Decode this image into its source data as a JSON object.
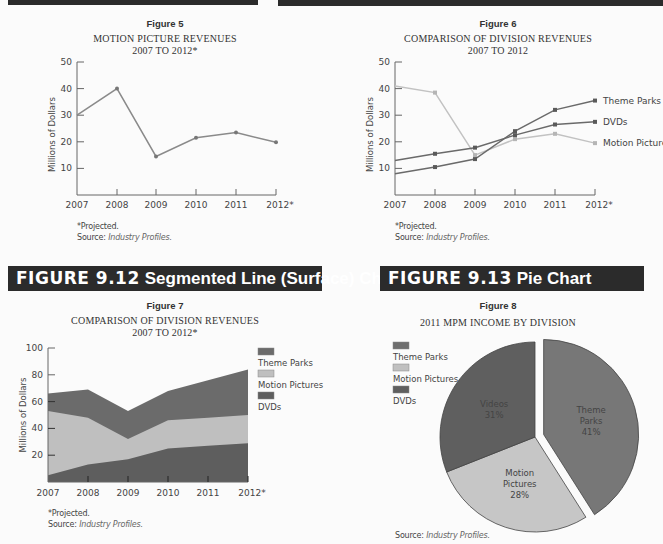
{
  "sections": {
    "top_left_bar": "",
    "top_right_bar": "",
    "fig912": {
      "num": "FIGURE 9.12",
      "title": "Segmented Line (Surface) Chart"
    },
    "fig913": {
      "num": "FIGURE 9.13",
      "title": "Pie Chart"
    }
  },
  "notes": {
    "projected": "*Projected.",
    "source_label": "Source:",
    "source_value": "Industry Profiles."
  },
  "colors": {
    "header_bar": "#2b2b2b",
    "theme_parks": "#6e6e6e",
    "motion_pictures": "#bdbdbd",
    "dvds": "#555555",
    "axis": "#666666"
  },
  "chart_data": [
    {
      "id": "figure5",
      "figure_label": "Figure 5",
      "type": "line",
      "title": "MOTION PICTURE REVENUES",
      "subtitle": "2007 TO 2012*",
      "xlabel": "",
      "ylabel": "Millions of Dollars",
      "x": [
        "2007",
        "2008",
        "2009",
        "2010",
        "2011",
        "2012*"
      ],
      "yticks": [
        10,
        20,
        30,
        40,
        50
      ],
      "ylim": [
        0,
        50
      ],
      "grid": false,
      "series": [
        {
          "name": "Motion Pictures",
          "values": [
            30,
            40,
            14.5,
            21.5,
            23.5,
            19.8
          ]
        }
      ],
      "notes": [
        "*Projected.",
        "Source: Industry Profiles."
      ]
    },
    {
      "id": "figure6",
      "figure_label": "Figure 6",
      "type": "line",
      "title": "COMPARISON OF DIVISION REVENUES",
      "subtitle": "2007 TO 2012",
      "xlabel": "",
      "ylabel": "Millions of Dollars",
      "x": [
        "2007",
        "2008",
        "2009",
        "2010",
        "2011",
        "2012*"
      ],
      "yticks": [
        10,
        20,
        30,
        40,
        50
      ],
      "ylim": [
        0,
        50
      ],
      "grid": false,
      "legend_position": "right (line-end labels)",
      "series": [
        {
          "name": "Theme Parks",
          "values": [
            8,
            10.5,
            13.5,
            24,
            32,
            35.5
          ]
        },
        {
          "name": "DVDs",
          "values": [
            13,
            15.5,
            17.8,
            22.5,
            26.5,
            27.5
          ]
        },
        {
          "name": "Motion Pictures",
          "values": [
            41,
            38.5,
            15,
            21,
            23,
            19.5
          ]
        }
      ],
      "notes": [
        "*Projected.",
        "Source: Industry Profiles."
      ]
    },
    {
      "id": "figure7",
      "figure_label": "Figure 7",
      "type": "area",
      "stacked": true,
      "title": "COMPARISON OF DIVISION REVENUES",
      "subtitle": "2007 TO 2012*",
      "xlabel": "",
      "ylabel": "Millions of Dollars",
      "x": [
        "2007",
        "2008",
        "2009",
        "2010",
        "2011",
        "2012*"
      ],
      "yticks": [
        20,
        40,
        60,
        80,
        100
      ],
      "ylim": [
        0,
        100
      ],
      "grid": false,
      "legend_position": "right",
      "legend": [
        "Theme Parks",
        "Motion Pictures",
        "DVDs"
      ],
      "series": [
        {
          "name": "DVDs",
          "values": [
            5,
            13,
            17,
            25,
            27,
            29
          ]
        },
        {
          "name": "Motion Pictures",
          "values": [
            48,
            35,
            15,
            21,
            21,
            21
          ]
        },
        {
          "name": "Theme Parks",
          "values": [
            13,
            21,
            21,
            22,
            28,
            34
          ]
        }
      ],
      "cumulative_tops": {
        "DVDs": [
          5,
          13,
          17,
          25,
          27,
          29
        ],
        "Motion Pictures": [
          53,
          48,
          32,
          46,
          48,
          50
        ],
        "Theme Parks": [
          66,
          69,
          53,
          68,
          76,
          84
        ]
      },
      "notes": [
        "*Projected.",
        "Source: Industry Profiles."
      ]
    },
    {
      "id": "figure8",
      "figure_label": "Figure 8",
      "type": "pie",
      "title": "2011 MPM INCOME BY DIVISION",
      "legend_position": "top-left",
      "legend": [
        "Theme Parks",
        "Motion Pictures",
        "DVDs"
      ],
      "slices": [
        {
          "label": "Theme Parks",
          "line1": "Theme",
          "line2": "Parks",
          "value": 41,
          "pct": "41%",
          "exploded": true
        },
        {
          "label": "Motion Pictures",
          "line1": "Motion",
          "line2": "Pictures",
          "value": 28,
          "pct": "28%",
          "exploded": false
        },
        {
          "label": "Videos",
          "line1": "Videos",
          "line2": "",
          "value": 31,
          "pct": "31%",
          "exploded": false
        }
      ],
      "notes": [
        "Source: Industry Profiles."
      ]
    }
  ]
}
